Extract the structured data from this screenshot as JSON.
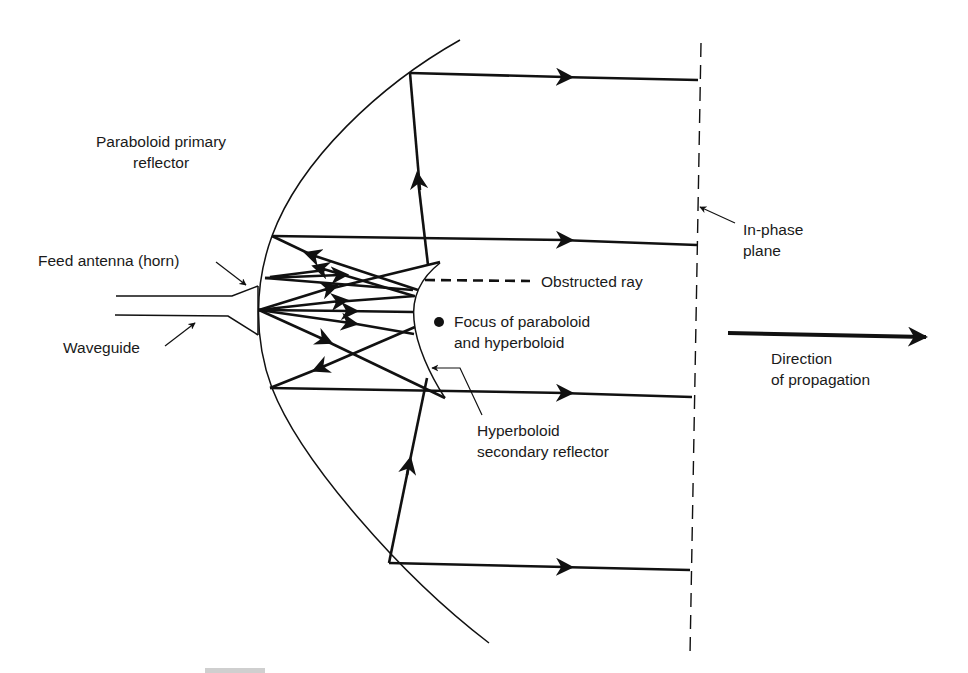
{
  "figure": {
    "labels": {
      "primary_reflector_line1": "Paraboloid primary",
      "primary_reflector_line2": "reflector",
      "feed_antenna": "Feed antenna (horn)",
      "waveguide": "Waveguide",
      "obstructed_ray": "Obstructed ray",
      "focus_line1": "Focus of paraboloid",
      "focus_line2": "and hyperboloid",
      "secondary_reflector_line1": "Hyperboloid",
      "secondary_reflector_line2": "secondary reflector",
      "in_phase_line1": "In-phase",
      "in_phase_line2": "plane",
      "direction_line1": "Direction",
      "direction_line2": "of propagation"
    },
    "components": [
      "paraboloid-primary-reflector",
      "hyperboloid-secondary-reflector",
      "feed-horn",
      "waveguide",
      "focus-point",
      "in-phase-plane",
      "parallel-output-rays",
      "obstructed-ray",
      "direction-of-propagation-arrow"
    ],
    "colors": {
      "ink": "#111111",
      "background": "#ffffff"
    }
  }
}
